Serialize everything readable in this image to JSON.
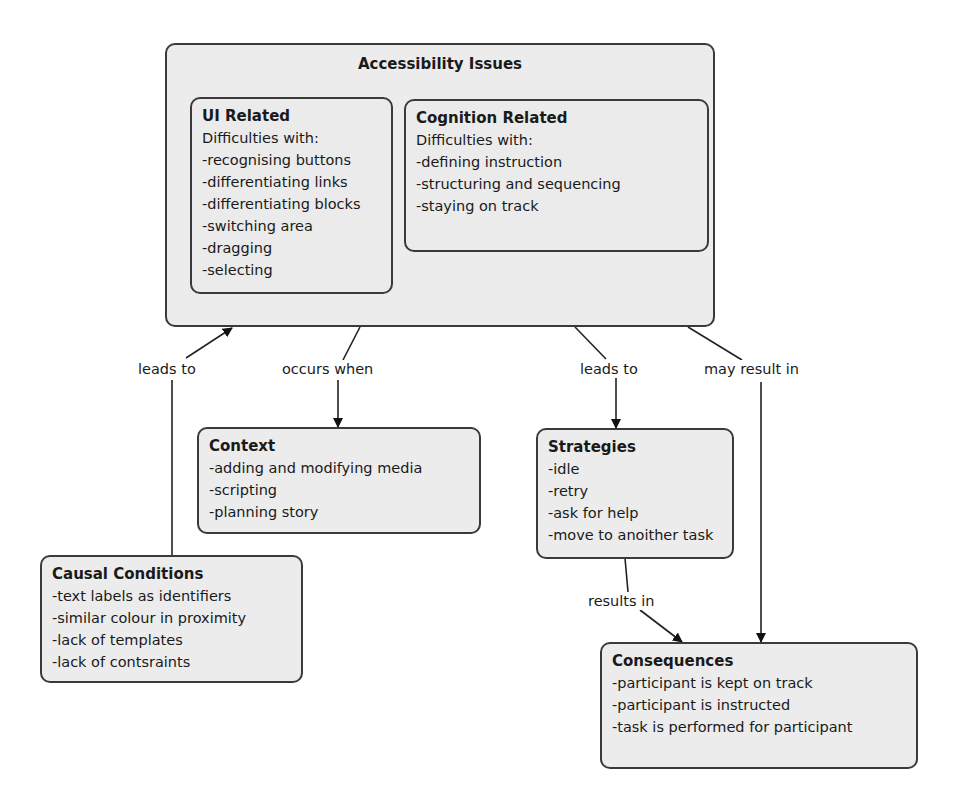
{
  "diagram": {
    "main": {
      "title": "Accessibility Issues",
      "ui_related": {
        "title": "UI Related",
        "intro": "Difficulties with:",
        "items": [
          "-recognising buttons",
          "-differentiating links",
          "-differentiating blocks",
          "-switching area",
          "-dragging",
          "-selecting"
        ]
      },
      "cognition_related": {
        "title": "Cognition Related",
        "intro": "Difficulties with:",
        "items": [
          "-defining instruction",
          "-structuring and sequencing",
          "-staying on track"
        ]
      }
    },
    "context": {
      "title": "Context",
      "items": [
        "-adding and modifying media",
        "-scripting",
        "-planning story"
      ]
    },
    "causal_conditions": {
      "title": "Causal Conditions",
      "items": [
        "-text labels as identifiers",
        "-similar colour in proximity",
        "-lack of templates",
        "-lack of contsraints"
      ]
    },
    "strategies": {
      "title": "Strategies",
      "items": [
        "-idle",
        "-retry",
        "-ask for help",
        "-move to anoither task"
      ]
    },
    "consequences": {
      "title": "Consequences",
      "items": [
        "-participant is kept on track",
        "-participant is instructed",
        "-task is performed for participant"
      ]
    },
    "links": {
      "causal_to_issues": "leads to",
      "issues_to_context": "occurs when",
      "issues_to_strategies": "leads to",
      "issues_to_consequences": "may result in",
      "strategies_to_consequences": "results in"
    }
  }
}
